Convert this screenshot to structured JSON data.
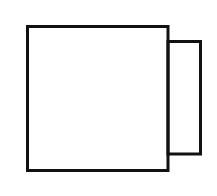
{
  "diagram": {
    "background": "#ffffff",
    "stroke_color": "#111111",
    "stroke_width": 3,
    "shapes": [
      {
        "id": "large-square",
        "type": "rect",
        "x": 27.5,
        "y": 26.5,
        "width": 140.5,
        "height": 144
      },
      {
        "id": "small-rectangle",
        "type": "rect",
        "x": 168,
        "y": 41.5,
        "width": 32.5,
        "height": 112.5
      }
    ]
  }
}
